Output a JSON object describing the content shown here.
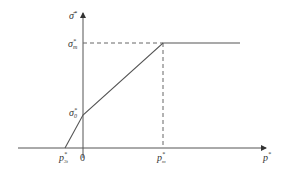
{
  "diagram": {
    "type": "piecewise-linear stress diagram",
    "colors": {
      "line": "#555555",
      "dashed": "#666666",
      "text": "#333333",
      "background": "#ffffff"
    },
    "axes": {
      "y_label": {
        "base": "σ̄",
        "sup": "*"
      },
      "x_label": {
        "base": "p",
        "sup": "*"
      },
      "origin_label": "0"
    },
    "y_ticks": [
      {
        "base": "σ",
        "sup": "*",
        "sub": "m"
      },
      {
        "base": "σ",
        "sup": "*",
        "sub": "0"
      }
    ],
    "x_ticks": [
      {
        "base": "p",
        "sup": "*",
        "sub": "3t"
      },
      {
        "base": "p",
        "sup": "*",
        "sub": "m"
      }
    ],
    "curve_points": [
      {
        "label": "p*3t",
        "x": 65,
        "y": 148
      },
      {
        "label": "σ*0",
        "x": 83,
        "y": 115
      },
      {
        "label": "(p*m, σ*m)",
        "x": 163,
        "y": 43
      },
      {
        "label": "end",
        "x": 240,
        "y": 43
      }
    ]
  }
}
